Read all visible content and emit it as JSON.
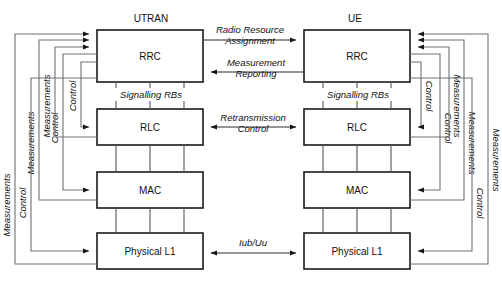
{
  "diagram": {
    "title_left": "UTRAN",
    "title_right": "UE",
    "layers": {
      "rrc": "RRC",
      "rlc": "RLC",
      "mac": "MAC",
      "phy": "Physical L1"
    },
    "interface_labels": {
      "signalling_rbs_left": "Signalling RBs",
      "signalling_rbs_right": "Signalling RBs"
    },
    "horizontal_flows": [
      {
        "id": "radio-resource-assignment",
        "line1": "Radio Resource",
        "line2": "Assignment",
        "direction": "left-to-right"
      },
      {
        "id": "measurement-reporting",
        "line1": "Measurement",
        "line2": "Reporting",
        "direction": "right-to-left"
      },
      {
        "id": "retransmission-control",
        "line1": "Retransmission",
        "line2": "Control",
        "direction": "bidirectional"
      },
      {
        "id": "iub-uu",
        "line1": "Iub/Uu",
        "line2": "",
        "direction": "bidirectional"
      }
    ],
    "left_side_rails": [
      {
        "id": "utran-control-rlc",
        "label": "Control"
      },
      {
        "id": "utran-control-mac",
        "label": "Control"
      },
      {
        "id": "utran-measurements-rlc",
        "label": "Measurements"
      },
      {
        "id": "utran-measurements-mac",
        "label": "Measurements"
      },
      {
        "id": "utran-control-phy",
        "label": "Control"
      },
      {
        "id": "utran-measurements-phy",
        "label": "Measurements"
      }
    ],
    "right_side_rails": [
      {
        "id": "ue-control-rlc",
        "label": "Control"
      },
      {
        "id": "ue-control-mac",
        "label": "Control"
      },
      {
        "id": "ue-measurements-rlc",
        "label": "Measurements"
      },
      {
        "id": "ue-measurements-mac",
        "label": "Measurements"
      },
      {
        "id": "ue-control-phy",
        "label": "Control"
      },
      {
        "id": "ue-measurements-phy",
        "label": "Measurements"
      }
    ],
    "colors": {
      "box_stroke": "#1a1a1a",
      "connector": "#55565a",
      "rail": "#6f7073",
      "text": "#111111",
      "background": "#ffffff"
    }
  }
}
